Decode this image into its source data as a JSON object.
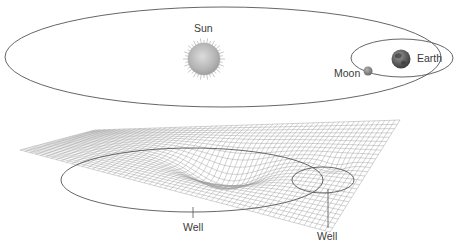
{
  "diagram": {
    "type": "gravity-well illustration",
    "top_panel": {
      "description": "Orbits of Earth around the Sun and Moon around Earth",
      "bodies": [
        {
          "name": "Sun",
          "label": "Sun"
        },
        {
          "name": "Earth",
          "label": "Earth"
        },
        {
          "name": "Moon",
          "label": "Moon"
        }
      ]
    },
    "bottom_panel": {
      "description": "Curved spacetime mesh showing two gravity wells",
      "labels": [
        {
          "label": "Well"
        },
        {
          "label": "Well"
        }
      ]
    },
    "colors": {
      "line": "#555555",
      "grid": "#9a9a9a",
      "sun": "#bdbdbd",
      "earth": "#6f6f6f",
      "moon": "#8a8a8a",
      "text": "#3a3a3a"
    }
  }
}
